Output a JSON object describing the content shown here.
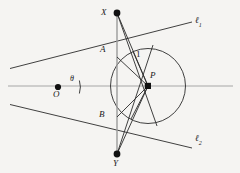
{
  "figure": {
    "type": "geometry-diagram",
    "background_color": "#f5f4f2",
    "stroke_color": "#1a1a1a",
    "axis_color": "#9a9a9a",
    "width": 240,
    "height": 173
  },
  "labels": {
    "x_point": "X",
    "y_point": "Y",
    "a_point": "A",
    "b_point": "B",
    "o_point": "O",
    "p_point": "P",
    "theta": "θ",
    "radius": "1",
    "line1": "ℓ",
    "line1_sub": "1",
    "line2": "ℓ",
    "line2_sub": "2"
  },
  "points": {
    "X": {
      "x": 117,
      "y": 13,
      "label_x": 103,
      "label_y": 9,
      "dot": true
    },
    "Y": {
      "x": 117,
      "y": 154,
      "label_x": 113,
      "label_y": 160,
      "dot": true
    },
    "O": {
      "x": 58,
      "y": 87,
      "label_x": 54,
      "label_y": 91,
      "dot": true
    },
    "P": {
      "x": 148,
      "y": 86,
      "label_x": 150,
      "label_y": 72,
      "dot": true
    },
    "A": {
      "x": 118,
      "y": 56,
      "label_x": 101,
      "label_y": 46,
      "dot": false
    },
    "B": {
      "x": 118,
      "y": 117,
      "label_x": 100,
      "label_y": 111,
      "dot": false
    }
  },
  "circle": {
    "cx": 148,
    "cy": 86,
    "r": 37.5
  },
  "angle_arc": {
    "cx": 58,
    "cy": 87,
    "r": 22,
    "label_x": 70,
    "label_y": 74
  },
  "radius_label": {
    "x": 136,
    "y": 50
  },
  "line_labels": {
    "l1": {
      "x": 196,
      "y": 18
    },
    "l2": {
      "x": 196,
      "y": 136
    }
  },
  "segments": {
    "axis": {
      "x1": 8,
      "y1": 86,
      "x2": 233,
      "y2": 86
    },
    "tangent1": {
      "x1": 10,
      "y1": 68,
      "x2": 192,
      "y2": 22
    },
    "tangent2": {
      "x1": 10,
      "y1": 104,
      "x2": 192,
      "y2": 148
    },
    "XY": {
      "x1": 117,
      "y1": 13,
      "x2": 117,
      "y2": 154
    },
    "XP": {
      "x1": 117,
      "y1": 13,
      "x2": 148,
      "y2": 86
    },
    "XB2": {
      "x1": 117,
      "y1": 13,
      "x2": 156,
      "y2": 122
    },
    "YP": {
      "x1": 117,
      "y1": 154,
      "x2": 148,
      "y2": 86
    },
    "YA2": {
      "x1": 117,
      "y1": 154,
      "x2": 152,
      "y2": 49
    },
    "PA": {
      "x1": 148,
      "y1": 86,
      "x2": 118,
      "y2": 56
    },
    "PB": {
      "x1": 148,
      "y1": 86,
      "x2": 118,
      "y2": 117
    },
    "PT1": {
      "x1": 148,
      "y1": 86,
      "x2": 128,
      "y2": 54
    },
    "PT2": {
      "x1": 148,
      "y1": 86,
      "x2": 128,
      "y2": 118
    }
  }
}
